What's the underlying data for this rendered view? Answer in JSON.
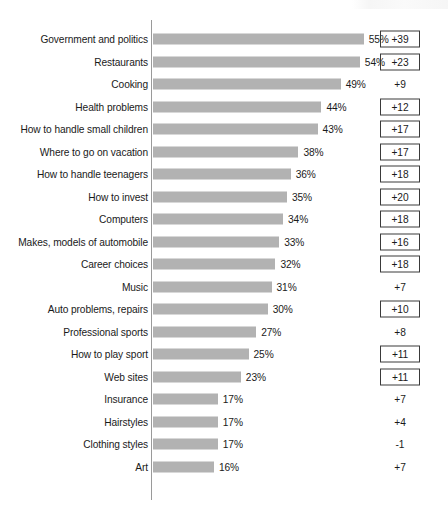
{
  "chart_data": {
    "type": "bar",
    "orientation": "horizontal",
    "title": "",
    "xlabel": "",
    "ylabel": "",
    "xlim": [
      0,
      55
    ],
    "grid": false,
    "legend": null,
    "value_suffix": "%",
    "categories": [
      "Government and politics",
      "Restaurants",
      "Cooking",
      "Health problems",
      "How to handle small children",
      "Where to go on vacation",
      "How to handle teenagers",
      "How to invest",
      "Computers",
      "Makes, models of automobile",
      "Career choices",
      "Music",
      "Auto problems, repairs",
      "Professional sports",
      "How to play sport",
      "Web sites",
      "Insurance",
      "Hairstyles",
      "Clothing styles",
      "Art"
    ],
    "values": [
      55,
      54,
      49,
      44,
      43,
      38,
      36,
      35,
      34,
      33,
      32,
      31,
      30,
      27,
      25,
      23,
      17,
      17,
      17,
      16
    ],
    "value_labels": [
      "55%",
      "54%",
      "49%",
      "44%",
      "43%",
      "38%",
      "36%",
      "35%",
      "34%",
      "33%",
      "32%",
      "31%",
      "30%",
      "27%",
      "25%",
      "23%",
      "17%",
      "17%",
      "17%",
      "16%"
    ],
    "series": [
      {
        "name": "Percent",
        "values": [
          55,
          54,
          49,
          44,
          43,
          38,
          36,
          35,
          34,
          33,
          32,
          31,
          30,
          27,
          25,
          23,
          17,
          17,
          17,
          16
        ]
      },
      {
        "name": "Change",
        "values": [
          39,
          23,
          9,
          12,
          17,
          17,
          18,
          20,
          18,
          16,
          18,
          7,
          10,
          8,
          11,
          11,
          7,
          4,
          -1,
          7
        ]
      }
    ],
    "change_labels": [
      "+39",
      "+23",
      "+9",
      "+12",
      "+17",
      "+17",
      "+18",
      "+20",
      "+18",
      "+16",
      "+18",
      "+7",
      "+10",
      "+8",
      "+11",
      "+11",
      "+7",
      "+4",
      "-1",
      "+7"
    ],
    "change_boxed": [
      true,
      true,
      false,
      true,
      true,
      true,
      true,
      true,
      true,
      true,
      true,
      false,
      true,
      false,
      true,
      true,
      false,
      false,
      false,
      false
    ],
    "colors": {
      "bar": "#b2b2b2",
      "axis": "#9a9a9a",
      "text": "#1a1a1a",
      "box_border": "#3a3a3a",
      "background": "#ffffff"
    }
  },
  "rows": [
    {
      "label": "Government and politics",
      "value": 55,
      "value_label": "55%",
      "change": "+39",
      "boxed": true
    },
    {
      "label": "Restaurants",
      "value": 54,
      "value_label": "54%",
      "change": "+23",
      "boxed": true
    },
    {
      "label": "Cooking",
      "value": 49,
      "value_label": "49%",
      "change": "+9",
      "boxed": false
    },
    {
      "label": "Health problems",
      "value": 44,
      "value_label": "44%",
      "change": "+12",
      "boxed": true
    },
    {
      "label": "How to handle small children",
      "value": 43,
      "value_label": "43%",
      "change": "+17",
      "boxed": true
    },
    {
      "label": "Where to go on vacation",
      "value": 38,
      "value_label": "38%",
      "change": "+17",
      "boxed": true
    },
    {
      "label": "How to handle teenagers",
      "value": 36,
      "value_label": "36%",
      "change": "+18",
      "boxed": true
    },
    {
      "label": "How to invest",
      "value": 35,
      "value_label": "35%",
      "change": "+20",
      "boxed": true
    },
    {
      "label": "Computers",
      "value": 34,
      "value_label": "34%",
      "change": "+18",
      "boxed": true
    },
    {
      "label": "Makes, models of automobile",
      "value": 33,
      "value_label": "33%",
      "change": "+16",
      "boxed": true
    },
    {
      "label": "Career choices",
      "value": 32,
      "value_label": "32%",
      "change": "+18",
      "boxed": true
    },
    {
      "label": "Music",
      "value": 31,
      "value_label": "31%",
      "change": "+7",
      "boxed": false
    },
    {
      "label": "Auto problems, repairs",
      "value": 30,
      "value_label": "30%",
      "change": "+10",
      "boxed": true
    },
    {
      "label": "Professional sports",
      "value": 27,
      "value_label": "27%",
      "change": "+8",
      "boxed": false
    },
    {
      "label": "How to play sport",
      "value": 25,
      "value_label": "25%",
      "change": "+11",
      "boxed": true
    },
    {
      "label": "Web sites",
      "value": 23,
      "value_label": "23%",
      "change": "+11",
      "boxed": true
    },
    {
      "label": "Insurance",
      "value": 17,
      "value_label": "17%",
      "change": "+7",
      "boxed": false
    },
    {
      "label": "Hairstyles",
      "value": 17,
      "value_label": "17%",
      "change": "+4",
      "boxed": false
    },
    {
      "label": "Clothing styles",
      "value": 17,
      "value_label": "17%",
      "change": "-1",
      "boxed": false
    },
    {
      "label": "Art",
      "value": 16,
      "value_label": "16%",
      "change": "+7",
      "boxed": false
    }
  ],
  "layout": {
    "axis_x": 151,
    "axis_top": 20,
    "axis_height": 480,
    "first_row_top": 28,
    "row_pitch": 22.5,
    "px_per_unit": 3.84,
    "bar_left": 152.5
  }
}
